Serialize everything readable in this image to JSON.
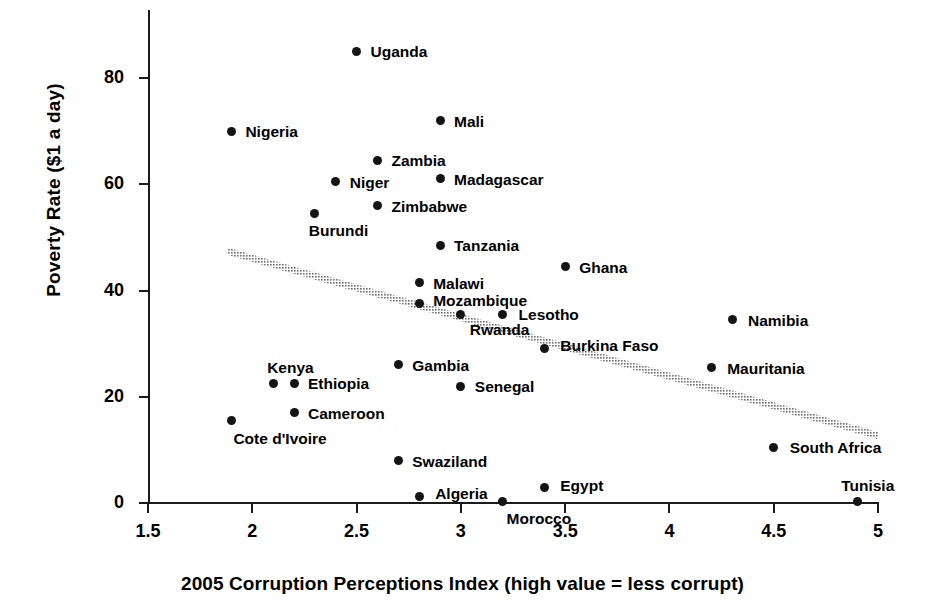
{
  "chart_data": {
    "type": "scatter",
    "title": "",
    "xlabel": "2005 Corruption Perceptions Index (high value = less corrupt)",
    "ylabel": "Poverty Rate ($1 a day)",
    "xlim": [
      1.5,
      5.0
    ],
    "ylim": [
      0,
      90
    ],
    "xticks": [
      "1.5",
      "2",
      "2.5",
      "3",
      "3.5",
      "4",
      "4.5",
      "5"
    ],
    "xtick_values": [
      1.5,
      2,
      2.5,
      3,
      3.5,
      4,
      4.5,
      5
    ],
    "yticks": [
      "0",
      "20",
      "40",
      "60",
      "80"
    ],
    "ytick_values": [
      0,
      20,
      40,
      60,
      80
    ],
    "grid": false,
    "legend": "none",
    "marker_color": "#141414",
    "trendline": {
      "label": "linear trend",
      "color": "#6e6e6e",
      "x_start": 1.88,
      "y_start": 47.4,
      "x_end": 5.0,
      "y_end": 12.7
    },
    "points": [
      {
        "label": "Uganda",
        "x": 2.5,
        "y": 85.0,
        "label_dx": 14,
        "label_dy": -7
      },
      {
        "label": "Mali",
        "x": 2.9,
        "y": 72.0,
        "label_dx": 14,
        "label_dy": -7
      },
      {
        "label": "Nigeria",
        "x": 1.9,
        "y": 70.0,
        "label_dx": 14,
        "label_dy": -7
      },
      {
        "label": "Zambia",
        "x": 2.6,
        "y": 64.5,
        "label_dx": 14,
        "label_dy": -7
      },
      {
        "label": "Niger",
        "x": 2.4,
        "y": 60.5,
        "label_dx": 14,
        "label_dy": -7
      },
      {
        "label": "Madagascar",
        "x": 2.9,
        "y": 61.0,
        "label_dx": 14,
        "label_dy": -7
      },
      {
        "label": "Zimbabwe",
        "x": 2.6,
        "y": 56.0,
        "label_dx": 14,
        "label_dy": -7
      },
      {
        "label": "Burundi",
        "x": 2.3,
        "y": 54.5,
        "label_dx": -6,
        "label_dy": 10
      },
      {
        "label": "Tanzania",
        "x": 2.9,
        "y": 48.5,
        "label_dx": 14,
        "label_dy": -7
      },
      {
        "label": "Ghana",
        "x": 3.5,
        "y": 44.5,
        "label_dx": 14,
        "label_dy": -7
      },
      {
        "label": "Malawi",
        "x": 2.8,
        "y": 41.5,
        "label_dx": 14,
        "label_dy": -7
      },
      {
        "label": "Mozambique",
        "x": 2.8,
        "y": 37.5,
        "label_dx": 14,
        "label_dy": -11
      },
      {
        "label": "Rwanda",
        "x": 3.0,
        "y": 35.5,
        "label_dx": 9,
        "label_dy": 8
      },
      {
        "label": "Lesotho",
        "x": 3.2,
        "y": 35.5,
        "label_dx": 16,
        "label_dy": -7
      },
      {
        "label": "Namibia",
        "x": 4.3,
        "y": 34.5,
        "label_dx": 16,
        "label_dy": -7
      },
      {
        "label": "Burkina Faso",
        "x": 3.4,
        "y": 29.0,
        "label_dx": 16,
        "label_dy": -11
      },
      {
        "label": "Gambia",
        "x": 2.7,
        "y": 26.0,
        "label_dx": 14,
        "label_dy": -7
      },
      {
        "label": "Mauritania",
        "x": 4.2,
        "y": 25.5,
        "label_dx": 16,
        "label_dy": -7
      },
      {
        "label": "Kenya",
        "x": 2.1,
        "y": 22.5,
        "label_dx": -6,
        "label_dy": -23
      },
      {
        "label": "Ethiopia",
        "x": 2.2,
        "y": 22.5,
        "label_dx": 14,
        "label_dy": -7
      },
      {
        "label": "Senegal",
        "x": 3.0,
        "y": 22.0,
        "label_dx": 14,
        "label_dy": -7
      },
      {
        "label": "Cameroon",
        "x": 2.2,
        "y": 17.0,
        "label_dx": 14,
        "label_dy": -7
      },
      {
        "label": "Cote d'Ivoire",
        "x": 1.9,
        "y": 15.5,
        "label_dx": 2,
        "label_dy": 10
      },
      {
        "label": "South Africa",
        "x": 4.5,
        "y": 10.5,
        "label_dx": 16,
        "label_dy": -7
      },
      {
        "label": "Swaziland",
        "x": 2.7,
        "y": 8.0,
        "label_dx": 14,
        "label_dy": -7
      },
      {
        "label": "Egypt",
        "x": 3.4,
        "y": 3.0,
        "label_dx": 16,
        "label_dy": -9
      },
      {
        "label": "Algeria",
        "x": 2.8,
        "y": 1.2,
        "label_dx": 16,
        "label_dy": -11
      },
      {
        "label": "Morocco",
        "x": 3.2,
        "y": 0.3,
        "label_dx": 4,
        "label_dy": 10
      },
      {
        "label": "Tunisia",
        "x": 4.9,
        "y": 0.2,
        "label_dx": -16,
        "label_dy": -24
      }
    ]
  }
}
